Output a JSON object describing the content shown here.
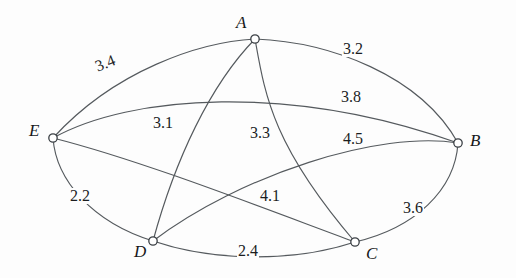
{
  "diagram": {
    "type": "node-link-graph",
    "stroke_color": "#555a5e",
    "node_stroke_color": "#3a3f44",
    "node_fill_color": "#ffffff",
    "text_color": "#1b1d1f",
    "background_color": "#fdfdfd",
    "width": 516,
    "height": 278
  },
  "nodes": [
    {
      "id": "A",
      "label": "A",
      "x": 255,
      "y": 39,
      "r": 4.2,
      "label_x": 236,
      "label_y": 14
    },
    {
      "id": "B",
      "label": "B",
      "x": 458,
      "y": 143,
      "r": 4.2,
      "label_x": 470,
      "label_y": 132
    },
    {
      "id": "C",
      "label": "C",
      "x": 355,
      "y": 242,
      "r": 4.2,
      "label_x": 366,
      "label_y": 245
    },
    {
      "id": "D",
      "label": "D",
      "x": 153,
      "y": 241,
      "r": 4.2,
      "label_x": 134,
      "label_y": 243
    },
    {
      "id": "E",
      "label": "E",
      "x": 53,
      "y": 138,
      "r": 4.2,
      "label_x": 29,
      "label_y": 122
    }
  ],
  "edges": [
    {
      "id": "AE",
      "from": "A",
      "to": "E",
      "weight": "3.4",
      "path": "M 255 39 C 200 42 115 70 53 138",
      "label_x": 92,
      "label_y": 60,
      "label_rotate": -22
    },
    {
      "id": "AB",
      "from": "A",
      "to": "B",
      "weight": "3.2",
      "path": "M 255 39 C 330 42 420 75 458 143",
      "label_x": 342,
      "label_y": 41,
      "label_rotate": 0
    },
    {
      "id": "AD",
      "from": "A",
      "to": "D",
      "weight": "3.1",
      "path": "M 255 39 C 210 85 175 160 153 241",
      "label_x": 152,
      "label_y": 115,
      "label_rotate": 0
    },
    {
      "id": "AC",
      "from": "A",
      "to": "C",
      "weight": "3.3",
      "path": "M 255 39 C 265 95 272 145 355 242",
      "label_x": 249,
      "label_y": 125,
      "label_rotate": 0
    },
    {
      "id": "EB",
      "from": "E",
      "to": "B",
      "weight": "3.8",
      "path": "M 53 138 C 130 95 290 83 458 143",
      "label_x": 340,
      "label_y": 89,
      "label_rotate": 0
    },
    {
      "id": "ED",
      "from": "E",
      "to": "D",
      "weight": "2.2",
      "path": "M 53 138 C 56 180 92 222 153 241",
      "label_x": 69,
      "label_y": 188,
      "label_rotate": 0
    },
    {
      "id": "EC",
      "from": "E",
      "to": "C",
      "weight": "4.1",
      "path": "M 53 138 C 140 160 255 205 355 242",
      "label_x": 259,
      "label_y": 188,
      "label_rotate": 0
    },
    {
      "id": "BD",
      "from": "B",
      "to": "D",
      "weight": "4.5",
      "path": "M 458 143 C 380 130 240 175 153 241",
      "label_x": 342,
      "label_y": 131,
      "label_rotate": 0
    },
    {
      "id": "BC",
      "from": "B",
      "to": "C",
      "weight": "3.6",
      "path": "M 458 143 C 455 190 415 228 355 242",
      "label_x": 402,
      "label_y": 200,
      "label_rotate": 0
    },
    {
      "id": "DC",
      "from": "D",
      "to": "C",
      "weight": "2.4",
      "path": "M 153 241 C 215 262 295 262 355 242",
      "label_x": 237,
      "label_y": 243,
      "label_rotate": 0
    }
  ]
}
